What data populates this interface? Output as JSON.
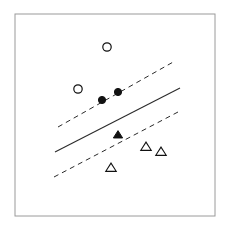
{
  "figure": {
    "title": "",
    "width": 229,
    "height": 234,
    "background_color": "#ffffff"
  },
  "frame": {
    "name": "plot-frame",
    "x": 15,
    "y": 14,
    "width": 200,
    "height": 202,
    "stroke_color": "#9a9a9a",
    "stroke_width": 1,
    "fill": "none"
  },
  "colors": {
    "marker_stroke": "#111111",
    "marker_fill_solid": "#111111",
    "marker_fill_open": "#ffffff",
    "line_color": "#2b2b2b",
    "frame_color": "#9a9a9a"
  },
  "chart_data": {
    "type": "scatter",
    "title": "",
    "subtitle": "",
    "xlabel": "",
    "ylabel": "",
    "xlim": [
      15,
      215
    ],
    "ylim": [
      14,
      216
    ],
    "grid": false,
    "axis_ticks": false,
    "legend": null,
    "legend_position": "none",
    "series": [
      {
        "name": "Class A (circles) - non-support vectors",
        "marker": "circle-open",
        "filled": false,
        "radius": 4.2,
        "points": [
          {
            "x": 107,
            "y": 47
          },
          {
            "x": 78,
            "y": 89
          }
        ]
      },
      {
        "name": "Class A (circles) - support vectors",
        "marker": "circle-filled",
        "filled": true,
        "radius": 3.6,
        "points": [
          {
            "x": 102,
            "y": 100
          },
          {
            "x": 118,
            "y": 92
          }
        ]
      },
      {
        "name": "Class B (triangles) - support vectors",
        "marker": "triangle-filled",
        "filled": true,
        "size": 8,
        "points": [
          {
            "x": 118,
            "y": 135
          }
        ]
      },
      {
        "name": "Class B (triangles) - non-support vectors",
        "marker": "triangle-open",
        "filled": false,
        "size": 9,
        "points": [
          {
            "x": 146,
            "y": 147
          },
          {
            "x": 161,
            "y": 152
          },
          {
            "x": 111,
            "y": 168
          }
        ]
      }
    ],
    "lines": [
      {
        "name": "upper-margin-line",
        "style": "dashed",
        "dash_pattern": "5,4",
        "x1": 58,
        "y1": 127,
        "x2": 175,
        "y2": 61,
        "stroke_width": 1
      },
      {
        "name": "decision-boundary-line",
        "style": "solid",
        "dash_pattern": "none",
        "x1": 55,
        "y1": 152,
        "x2": 180,
        "y2": 88,
        "stroke_width": 1.1
      },
      {
        "name": "lower-margin-line",
        "style": "dashed",
        "dash_pattern": "5,4",
        "x1": 54,
        "y1": 177,
        "x2": 178,
        "y2": 112,
        "stroke_width": 1
      }
    ]
  }
}
